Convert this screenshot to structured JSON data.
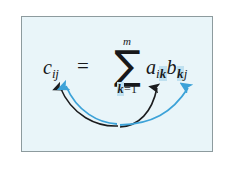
{
  "figure": {
    "kind": "math-formula-diagram",
    "panel": {
      "background_color": "#e9f5f9",
      "border_color": "#8d9b9e",
      "page_background": "#ffffff"
    },
    "formula": {
      "left_side": {
        "base": "c",
        "subscript": "ij",
        "full": "c_ij"
      },
      "relation": "=",
      "summation": {
        "symbol": "∑",
        "upper_limit": "m",
        "lower_limit_index": "k",
        "lower_limit_equals": "=",
        "lower_limit_value": "1",
        "lower_limit_full": "k=1"
      },
      "right_side": {
        "first_factor": {
          "base": "a",
          "subscript_first": "i",
          "subscript_second": "k",
          "full": "a_ik"
        },
        "second_factor": {
          "base": "b",
          "subscript_first": "k",
          "subscript_second": "j",
          "full": "b_kj"
        }
      },
      "plain_text": "c_ij = sum_{k=1}^{m} a_ik b_kj"
    },
    "highlight": {
      "color": "#bfe0ef",
      "highlighted_symbols": [
        "k",
        "k",
        "k"
      ],
      "note": "summation index k highlighted in sigma lower limit and in both subscripts"
    },
    "arrows": [
      {
        "name": "black-arrow-to-c",
        "color": "#1b1c1e",
        "from": "bottom-center",
        "to": "c-subscript",
        "style": "curved"
      },
      {
        "name": "black-arrow-to-a",
        "color": "#1b1c1e",
        "from": "bottom-center",
        "to": "a-subscript-k",
        "style": "curved"
      },
      {
        "name": "blue-arrow-to-c",
        "color": "#3ca2d8",
        "from": "bottom-center",
        "to": "c-subscript",
        "style": "curved"
      },
      {
        "name": "blue-arrow-to-b",
        "color": "#3ca2d8",
        "from": "bottom-center",
        "to": "b-subscript-k",
        "style": "curved"
      }
    ]
  }
}
